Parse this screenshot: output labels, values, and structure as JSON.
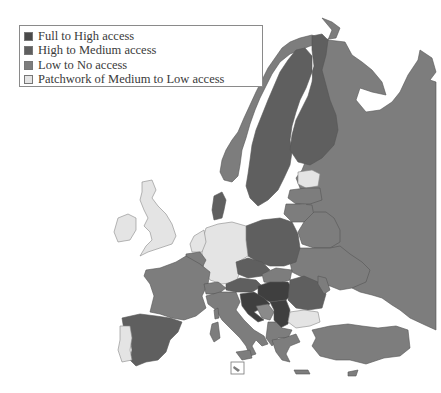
{
  "legend": {
    "items": [
      {
        "label": "Full to High access",
        "color": "#4a4a4a"
      },
      {
        "label": "High to Medium access",
        "color": "#5f5f5f"
      },
      {
        "label": "Low to No access",
        "color": "#7d7d7d"
      },
      {
        "label": "Patchwork of Medium to Low access",
        "color": "#e4e4e4"
      }
    ]
  },
  "map": {
    "region": "Europe",
    "categories": {
      "full_to_high": [
        "Hungary",
        "Serbia",
        "Croatia",
        "Slovenia"
      ],
      "high_to_medium": [
        "Sweden",
        "Finland",
        "Denmark",
        "Poland",
        "Spain",
        "Czech Republic",
        "Romania",
        "Austria"
      ],
      "low_to_no": [
        "Norway",
        "Russia",
        "France",
        "Italy",
        "Belgium",
        "Switzerland",
        "Latvia",
        "Lithuania",
        "Belarus",
        "Ukraine",
        "Moldova",
        "Slovakia",
        "Bosnia and Herzegovina",
        "Montenegro",
        "Albania",
        "North Macedonia",
        "Greece",
        "Turkey",
        "Corsica",
        "Sardinia",
        "Sicily",
        "Crete",
        "Cyprus"
      ],
      "patchwork_medium_to_low": [
        "United Kingdom",
        "Ireland",
        "Germany",
        "Netherlands",
        "Portugal",
        "Estonia",
        "Bulgaria"
      ]
    },
    "inset_label": "Malta inset"
  }
}
